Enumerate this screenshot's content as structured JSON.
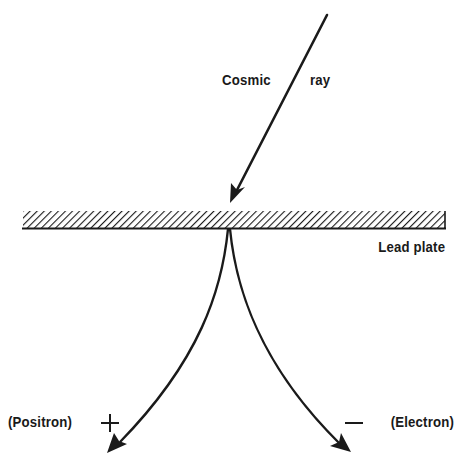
{
  "diagram": {
    "labels": {
      "cosmic": "Cosmic",
      "ray": "ray",
      "lead_plate": "Lead plate",
      "positron": "(Positron)",
      "positron_sign": "+",
      "electron_sign": "—",
      "electron": "(Electron)"
    },
    "colors": {
      "ink": "#1a1a1a",
      "background": "#ffffff"
    },
    "elements": [
      {
        "name": "cosmic-ray-track",
        "description": "incoming straight arrow to lead plate"
      },
      {
        "name": "lead-plate",
        "description": "hatched horizontal plate"
      },
      {
        "name": "positron-track",
        "description": "curved arrow bending left"
      },
      {
        "name": "electron-track",
        "description": "curved arrow bending right"
      }
    ]
  }
}
